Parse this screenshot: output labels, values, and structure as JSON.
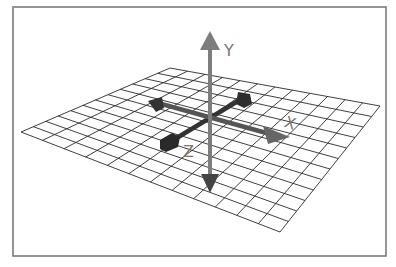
{
  "diagram": {
    "grid": {
      "divisions": 12
    },
    "axes": [
      {
        "id": "y",
        "label": "Y",
        "color": "#7d7d7d",
        "direction": "up"
      },
      {
        "id": "x",
        "label": "X",
        "color": "#6e6e6e",
        "direction": "right"
      },
      {
        "id": "z",
        "label": "Z",
        "color": "#3a3a3a",
        "direction": "toward-viewer"
      }
    ],
    "colors": {
      "frame": "#7a7a7a",
      "grid": "#2a2a2a",
      "background": "#ffffff"
    }
  }
}
